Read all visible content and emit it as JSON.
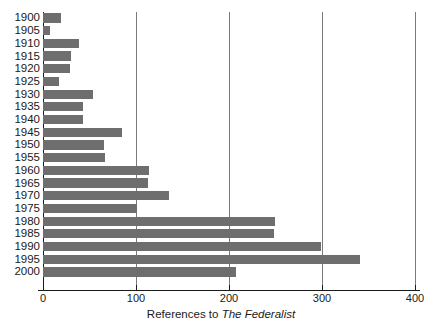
{
  "chart_data": {
    "type": "bar",
    "orientation": "horizontal",
    "title": "",
    "subtitle": "",
    "xlabel_prefix": "References to ",
    "xlabel_italic": "The Federalist",
    "xlabel": "References to The Federalist",
    "ylabel": "",
    "xlim": [
      0,
      400
    ],
    "xticks": [
      0,
      100,
      200,
      300,
      400
    ],
    "xtick_labels": [
      "0",
      "100",
      "200",
      "300",
      "400"
    ],
    "grid": "vertical",
    "legend": "none",
    "bar_color": "#6e6e6e",
    "axis_color": "#1a1a1a",
    "gridline_color": "#7a7a7a",
    "background_color": "#ffffff",
    "categories": [
      "1900",
      "1905",
      "1910",
      "1915",
      "1920",
      "1925",
      "1930",
      "1935",
      "1940",
      "1945",
      "1950",
      "1955",
      "1960",
      "1965",
      "1970",
      "1975",
      "1980",
      "1985",
      "1990",
      "1995",
      "2000"
    ],
    "values": [
      19,
      8,
      39,
      30,
      29,
      17,
      54,
      43,
      43,
      85,
      66,
      67,
      114,
      113,
      135,
      101,
      249,
      248,
      299,
      341,
      208
    ]
  }
}
